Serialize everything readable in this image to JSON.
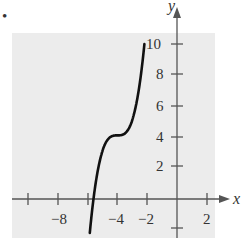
{
  "chart_data": {
    "type": "line",
    "title": "",
    "xlabel": "x",
    "ylabel": "y",
    "xlim": [
      -10,
      2.5
    ],
    "ylim": [
      -2,
      10.5
    ],
    "grid": false,
    "x_ticks": [
      -10,
      -8,
      -6,
      -4,
      -2,
      2
    ],
    "x_tick_labels": [
      "-8",
      "-4",
      "-2",
      "2"
    ],
    "y_ticks": [
      -2,
      2,
      4,
      6,
      8,
      10
    ],
    "y_tick_labels": [
      "2",
      "4",
      "6",
      "8",
      "10"
    ],
    "series": [
      {
        "name": "y = (x+4)^3 + 4",
        "x": [
          -5.9,
          -5.59,
          -5.5,
          -5.0,
          -4.5,
          -4.0,
          -3.5,
          -3.0,
          -2.5,
          -2.18
        ],
        "values": [
          -2.86,
          0.0,
          0.63,
          3.0,
          3.88,
          4.0,
          4.13,
          5.0,
          7.38,
          10.0
        ]
      }
    ],
    "bullet": "•"
  },
  "labels": {
    "x_axis": "x",
    "y_axis": "y",
    "xt_m8": "−8",
    "xt_m4": "−4",
    "xt_m2": "−2",
    "xt_2": "2",
    "yt_2": "2",
    "yt_4": "4",
    "yt_6": "6",
    "yt_8": "8",
    "yt_10": "10",
    "bullet": "•"
  }
}
